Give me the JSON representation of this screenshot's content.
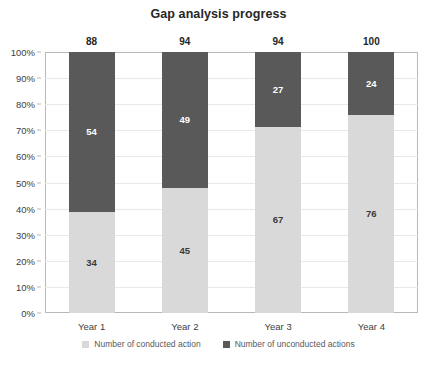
{
  "chart_data": {
    "type": "bar",
    "subtype": "stacked-100-percent",
    "title": "Gap analysis progress",
    "xlabel": "",
    "ylabel": "",
    "categories": [
      "Year 1",
      "Year 2",
      "Year 3",
      "Year 4"
    ],
    "series": [
      {
        "name": "Number of conducted action",
        "color": "#d9d9d9",
        "values": [
          34,
          45,
          67,
          76
        ]
      },
      {
        "name": "Number of unconducted actions",
        "color": "#595959",
        "values": [
          54,
          49,
          27,
          24
        ]
      }
    ],
    "totals": [
      88,
      94,
      94,
      100
    ],
    "ylim": [
      0,
      100
    ],
    "ytick_labels": [
      "0%",
      "10%",
      "20%",
      "30%",
      "40%",
      "50%",
      "60%",
      "70%",
      "80%",
      "90%",
      "100%"
    ],
    "ytick_values": [
      0,
      10,
      20,
      30,
      40,
      50,
      60,
      70,
      80,
      90,
      100
    ],
    "grid": true,
    "legend_position": "bottom",
    "plot_border_color": "#b8b8b8",
    "gridline_color": "#e8e8e8",
    "background_color": "#ffffff"
  }
}
